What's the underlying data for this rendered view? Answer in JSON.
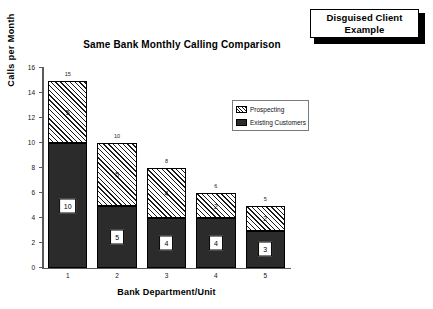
{
  "callout": {
    "text": "Disguised Client\nExample"
  },
  "chart_data": {
    "type": "bar",
    "title": "Same Bank Monthly Calling Comparison",
    "xlabel": "Bank Department/Unit",
    "ylabel": "Calls per Month",
    "ylim": [
      0,
      16
    ],
    "ytick_labels": [
      "16",
      "14",
      "12",
      "10",
      "8",
      "6",
      "4",
      "2",
      "0"
    ],
    "ytick_values": [
      16,
      14,
      12,
      10,
      8,
      6,
      4,
      2,
      0
    ],
    "grid": false,
    "stacked": true,
    "legend_position": "upper-right-inside",
    "categories": [
      "1",
      "2",
      "3",
      "4",
      "5"
    ],
    "series": [
      {
        "name": "Existing Customers",
        "values": [
          10,
          5,
          4,
          4,
          3
        ],
        "color": "#2b2b2b",
        "pattern": "solid-dark"
      },
      {
        "name": "Prospecting",
        "values": [
          5,
          5,
          4,
          2,
          2
        ],
        "color": "#ffffff",
        "pattern": "diagonal-hatch"
      }
    ],
    "totals": [
      15,
      10,
      8,
      6,
      5
    ],
    "segment_labels": {
      "existing": [
        "10",
        "5",
        "4",
        "4",
        "3"
      ],
      "prospecting": [
        "5",
        "5",
        "4",
        "2",
        "2"
      ]
    },
    "total_labels": [
      "15",
      "10",
      "8",
      "6",
      "5"
    ]
  },
  "legend": {
    "items": [
      {
        "label": "Prospecting",
        "swatch": "diagonal-hatch"
      },
      {
        "label": "Existing Customers",
        "swatch": "solid-dark"
      }
    ]
  }
}
